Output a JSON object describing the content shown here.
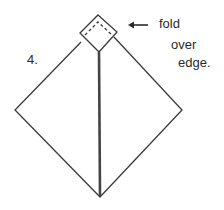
{
  "step_number": "4.",
  "instruction": {
    "line1": "fold",
    "line2": "over",
    "line3": "edge."
  },
  "colors": {
    "line": "#3a3a3a",
    "center_crease": "#444444",
    "text": "#2a2a2a",
    "background": "#ffffff"
  }
}
